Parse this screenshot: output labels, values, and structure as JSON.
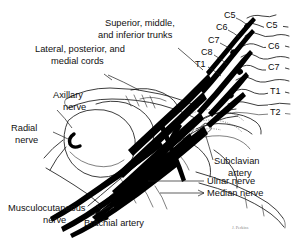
{
  "figure": {
    "background_color": "#ffffff",
    "line_color": "#000000",
    "width": 294,
    "height": 244
  },
  "annotations": {
    "trunks": {
      "line1": "Superior, middle,",
      "line2": "and inferior trunks"
    },
    "cords": {
      "line1": "Lateral, posterior, and",
      "line2": "medial cords"
    },
    "axillary": {
      "line1": "Axillary",
      "line2": "nerve"
    },
    "radial": {
      "line1": "Radial",
      "line2": "nerve"
    },
    "musculocutaneous": {
      "line1": "Musculocutaneous",
      "line2": "nerve"
    },
    "brachial_artery": {
      "line1": "Brachial artery"
    },
    "subclavian": {
      "line1": "Subclavian",
      "line2": "artery"
    },
    "ulnar": {
      "line1": "Ulnar nerve"
    },
    "median": {
      "line1": "Median nerve"
    }
  },
  "nerve_roots": [
    {
      "label": "C5"
    },
    {
      "label": "C6"
    },
    {
      "label": "C7"
    },
    {
      "label": "C8"
    },
    {
      "label": "T1"
    }
  ],
  "vertebrae": [
    {
      "label": "C5"
    },
    {
      "label": "C6"
    },
    {
      "label": "C7"
    },
    {
      "label": "T1"
    },
    {
      "label": "T2"
    }
  ],
  "signature": "J. Perkins"
}
